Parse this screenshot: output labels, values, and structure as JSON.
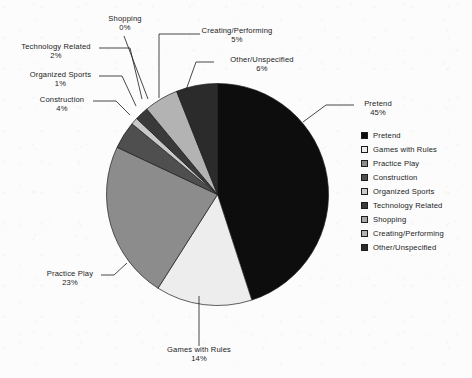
{
  "chart_data": {
    "type": "pie",
    "title": "",
    "xlabel": "",
    "ylabel": "",
    "legend_position": "right",
    "grid": false,
    "start_angle_deg": 0,
    "direction": "clockwise",
    "categories": [
      "Pretend",
      "Games with Rules",
      "Practice Play",
      "Construction",
      "Organized Sports",
      "Technology Related",
      "Shopping",
      "Creating/Performing",
      "Other/Unspecified"
    ],
    "values": [
      45,
      14,
      23,
      4,
      1,
      2,
      0,
      5,
      6
    ],
    "value_labels": [
      "45%",
      "14%",
      "23%",
      "4%",
      "1%",
      "2%",
      "0%",
      "5%",
      "6%"
    ],
    "colors": [
      "#0d0d0d",
      "#ededed",
      "#8c8c8c",
      "#4f4f4f",
      "#c9c9c9",
      "#3a3a3a",
      "#a8a8a8",
      "#b3b3b3",
      "#2b2b2b"
    ],
    "slice_edge_color": "#1d1d1d",
    "background_color": "#fcfcfc",
    "text_color": "#1b1b1b"
  },
  "callouts": [
    {
      "name": "Shopping",
      "pct": "0%"
    },
    {
      "name": "Creating/Performing",
      "pct": "5%"
    },
    {
      "name": "Technology Related",
      "pct": "2%"
    },
    {
      "name": "Other/Unspecified",
      "pct": "6%"
    },
    {
      "name": "Organized Sports",
      "pct": "1%"
    },
    {
      "name": "Construction",
      "pct": "4%"
    },
    {
      "name": "Pretend",
      "pct": "45%"
    },
    {
      "name": "Practice Play",
      "pct": "23%"
    },
    {
      "name": "Games with Rules",
      "pct": "14%"
    }
  ],
  "legend": {
    "items": [
      {
        "label": "Pretend",
        "color": "#0d0d0d"
      },
      {
        "label": "Games with Rules",
        "color": "#ededed"
      },
      {
        "label": "Practice Play",
        "color": "#8c8c8c"
      },
      {
        "label": "Construction",
        "color": "#4f4f4f"
      },
      {
        "label": "Organized Sports",
        "color": "#c9c9c9"
      },
      {
        "label": "Technology Related",
        "color": "#3a3a3a"
      },
      {
        "label": "Shopping",
        "color": "#a8a8a8"
      },
      {
        "label": "Creating/Performing",
        "color": "#b3b3b3"
      },
      {
        "label": "Other/Unspecified",
        "color": "#2b2b2b"
      }
    ]
  }
}
